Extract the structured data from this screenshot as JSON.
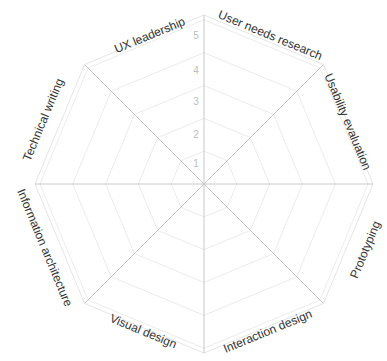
{
  "chart_data": {
    "type": "radar",
    "title": "",
    "categories": [
      "User needs research",
      "Usability evaluation",
      "Prototyping",
      "Interaction design",
      "Visual design",
      "Information architecture",
      "Technical writing",
      "UX leadership"
    ],
    "series": [],
    "radial_ticks": [
      "1",
      "2",
      "3",
      "4",
      "5"
    ],
    "rlim": [
      0,
      5.15
    ],
    "grid": true,
    "grid_shape": "octagon",
    "legend": "none",
    "colors": {
      "grid": "#ececec",
      "axis": "#c8c8c8",
      "tick_text": "#bdbdbd",
      "label_text": "#333333"
    }
  }
}
